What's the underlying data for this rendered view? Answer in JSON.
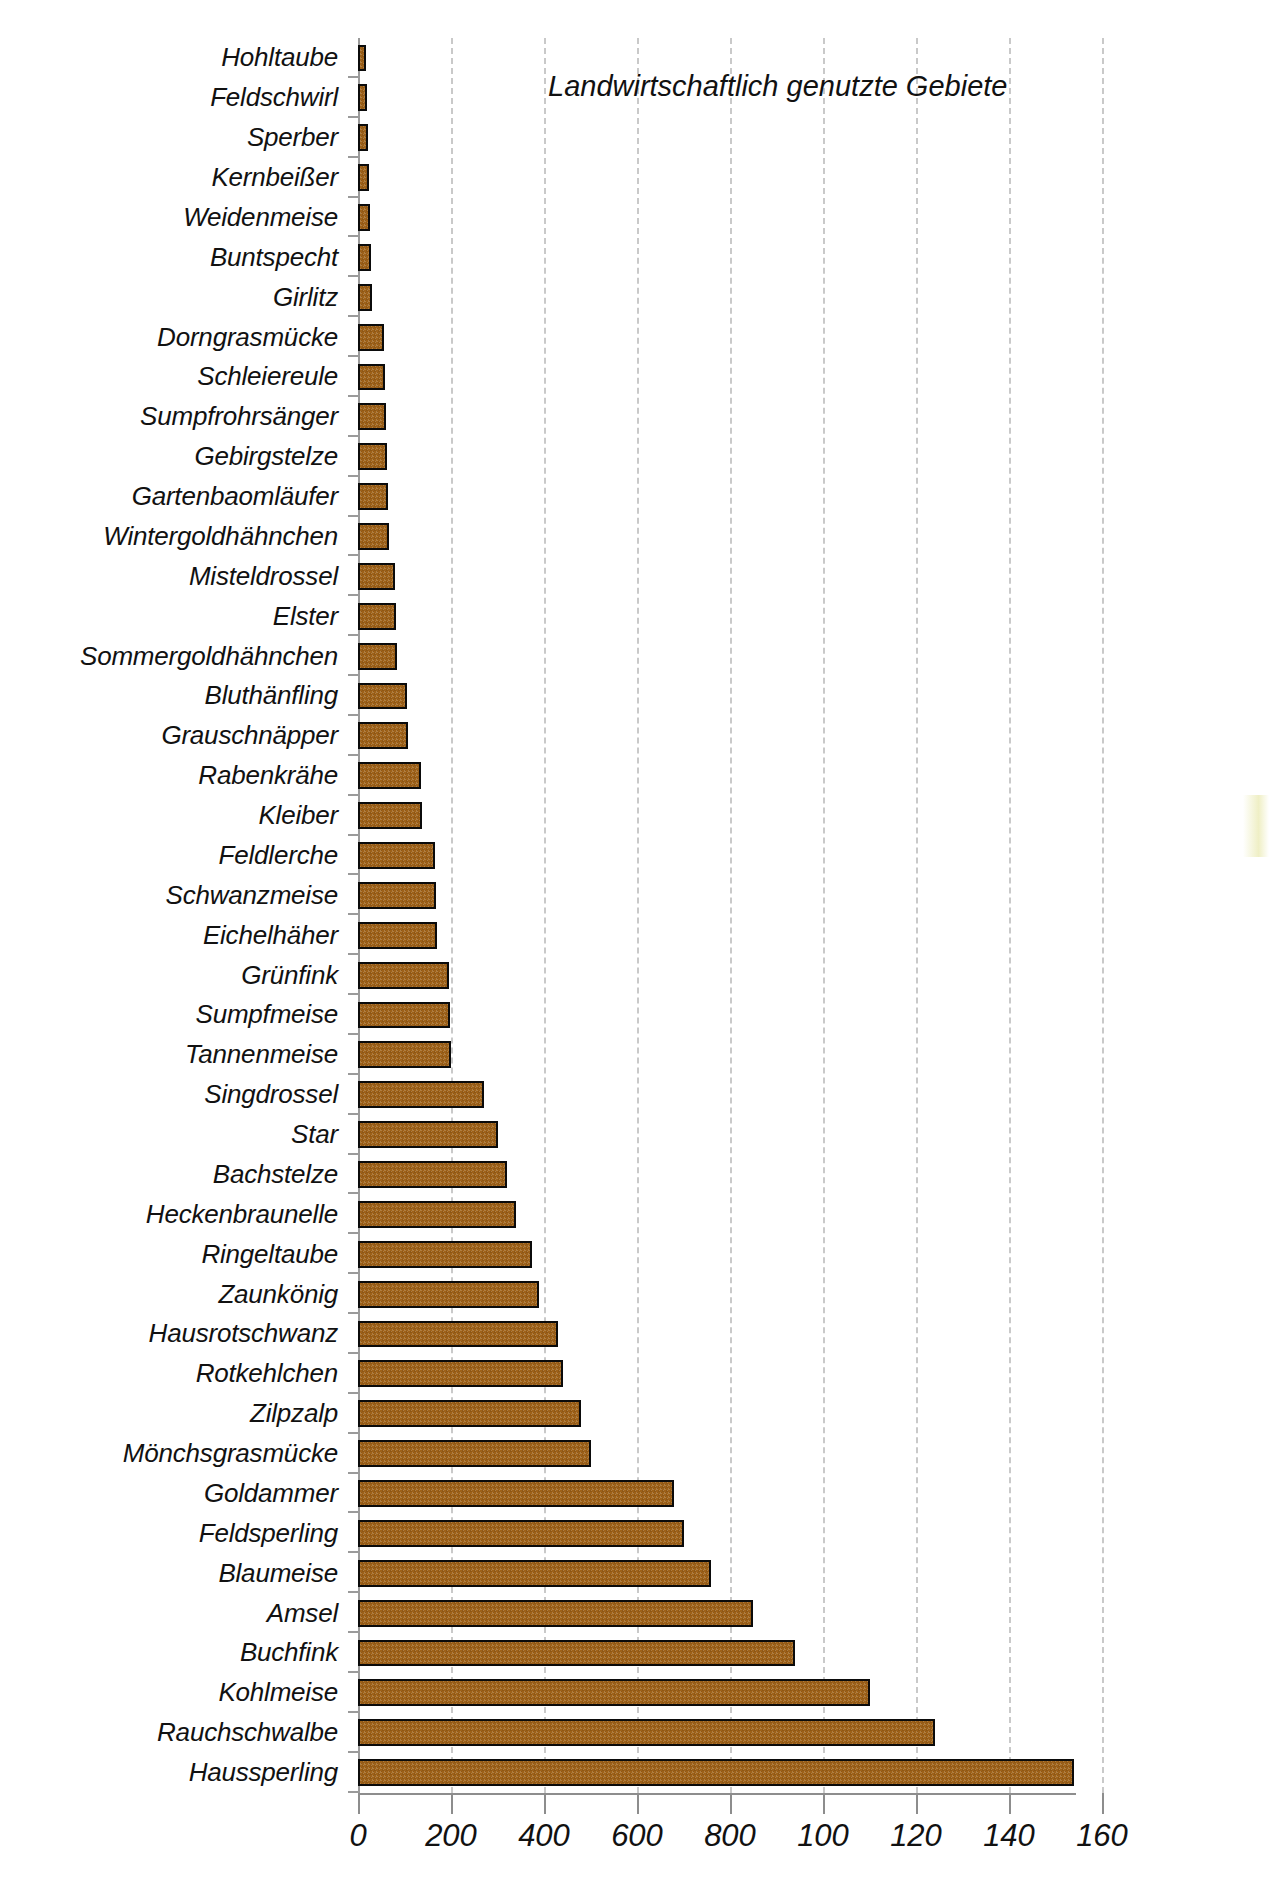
{
  "chart_data": {
    "type": "bar",
    "orientation": "horizontal",
    "title": "Landwirtschaftlich genutzte Gebiete",
    "xlabel": "",
    "ylabel": "",
    "xlim": [
      0,
      1650
    ],
    "xticks": [
      0,
      200,
      400,
      600,
      800,
      1000,
      1200,
      1400,
      1600
    ],
    "xtick_labels": [
      "0",
      "200",
      "400",
      "600",
      "800",
      "100",
      "120",
      "140",
      "160"
    ],
    "grid": "vertical-dashed",
    "legend": "none",
    "bar_color": "#9e6118",
    "bar_edge_color": "#0b0b0b",
    "grid_color": "#c9c9c9",
    "axis_color": "#8d8d8d",
    "categories": [
      "Hohltaube",
      "Feldschwirl",
      "Sperber",
      "Kernbeißer",
      "Weidenmeise",
      "Buntspecht",
      "Girlitz",
      "Dorngrasmücke",
      "Schleiereule",
      "Sumpfrohrsänger",
      "Gebirgstelze",
      "Gartenbaomläufer",
      "Wintergoldhähnchen",
      "Misteldrossel",
      "Elster",
      "Sommergoldhähnchen",
      "Bluthänfling",
      "Grauschnäpper",
      "Rabenkrähe",
      "Kleiber",
      "Feldlerche",
      "Schwanzmeise",
      "Eichelhäher",
      "Grünfink",
      "Sumpfmeise",
      "Tannenmeise",
      "Singdrossel",
      "Star",
      "Bachstelze",
      "Heckenbraunelle",
      "Ringeltaube",
      "Zaunkönig",
      "Hausrotschwanz",
      "Rotkehlchen",
      "Zilpzalp",
      "Mönchsgrasmücke",
      "Goldammer",
      "Feldsperling",
      "Blaumeise",
      "Amsel",
      "Buchfink",
      "Kohlmeise",
      "Rauchschwalbe",
      "Haussperling"
    ],
    "values": [
      18,
      20,
      22,
      24,
      26,
      28,
      30,
      55,
      58,
      60,
      62,
      64,
      66,
      80,
      82,
      84,
      105,
      108,
      135,
      138,
      165,
      168,
      170,
      195,
      198,
      200,
      270,
      300,
      320,
      340,
      375,
      390,
      430,
      440,
      480,
      500,
      680,
      700,
      760,
      850,
      940,
      1100,
      1240,
      1540
    ]
  }
}
